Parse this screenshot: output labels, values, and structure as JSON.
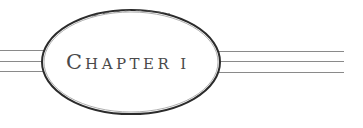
{
  "heading": {
    "initial": "C",
    "rest": "HAPTER",
    "number": "I",
    "full_text": "Chapter 1"
  },
  "colors": {
    "ink": "#2b2b2b",
    "rule": "#8a8a8a",
    "text": "#4a4a4a"
  }
}
